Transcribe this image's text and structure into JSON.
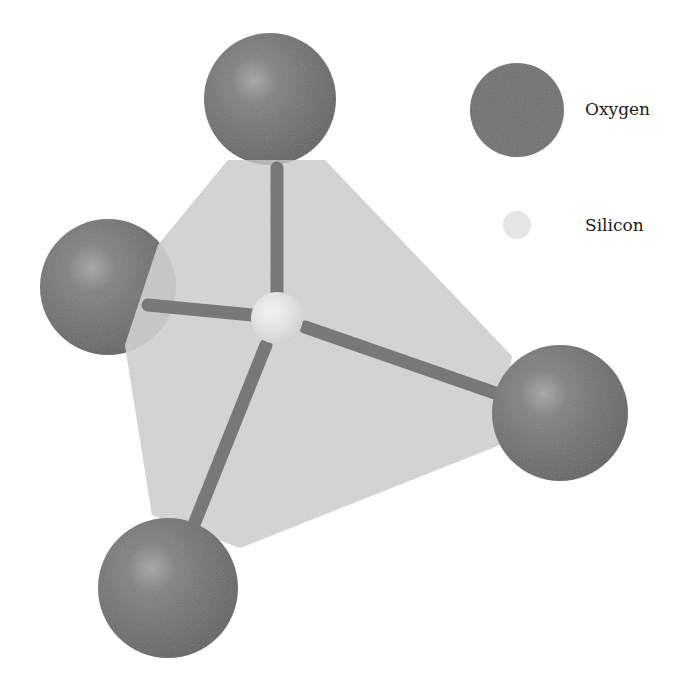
{
  "diagram": {
    "colors": {
      "oxygen": "#6e6e6e",
      "oxygen_highlight": "#a4a4a4",
      "silicon": "#e6e6e6",
      "bond": "#7a7a7a",
      "tetrahedron_face": "#cfcfcf",
      "tetrahedron_face_light": "#dcdcdc",
      "background": "#ffffff"
    },
    "atoms": [
      {
        "element": "Oxygen",
        "position": "top",
        "cx": 270,
        "cy": 99,
        "r": 66
      },
      {
        "element": "Oxygen",
        "position": "left",
        "cx": 108,
        "cy": 287,
        "r": 68
      },
      {
        "element": "Oxygen",
        "position": "right",
        "cx": 560,
        "cy": 413,
        "r": 68
      },
      {
        "element": "Oxygen",
        "position": "bottom",
        "cx": 168,
        "cy": 588,
        "r": 70
      },
      {
        "element": "Silicon",
        "position": "center",
        "cx": 277,
        "cy": 318,
        "r": 26
      }
    ],
    "bonds": [
      {
        "from": "Silicon",
        "to": "Oxygen-top"
      },
      {
        "from": "Silicon",
        "to": "Oxygen-left"
      },
      {
        "from": "Silicon",
        "to": "Oxygen-right"
      },
      {
        "from": "Silicon",
        "to": "Oxygen-bottom"
      }
    ]
  },
  "legend": {
    "items": [
      {
        "label": "Oxygen",
        "symbol": "large dark gray sphere"
      },
      {
        "label": "Silicon",
        "symbol": "small light gray sphere"
      }
    ]
  }
}
